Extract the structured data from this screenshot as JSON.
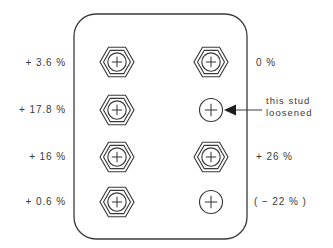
{
  "figure": {
    "plate": {
      "name": "plate",
      "x": 74,
      "y": 14,
      "width": 173,
      "height": 225,
      "corner_radius": 22,
      "stroke_color": "#3a3a3a",
      "fill_color": "#ffffff"
    },
    "ink_color": "#3a3a3a",
    "background_color": "#ffffff"
  },
  "studs": [
    {
      "id": "stud-left-1",
      "column": "left",
      "row": 1,
      "cx": 117,
      "cy": 62,
      "has_nut": true,
      "label": "+ 3.6 %",
      "label_side": "left"
    },
    {
      "id": "stud-left-2",
      "column": "left",
      "row": 2,
      "cx": 117,
      "cy": 110,
      "has_nut": true,
      "label": "+ 17.8 %",
      "label_side": "left"
    },
    {
      "id": "stud-left-3",
      "column": "left",
      "row": 3,
      "cx": 117,
      "cy": 157,
      "has_nut": true,
      "label": "+ 16 %",
      "label_side": "left"
    },
    {
      "id": "stud-left-4",
      "column": "left",
      "row": 4,
      "cx": 117,
      "cy": 202,
      "has_nut": true,
      "label": "+ 0.6 %",
      "label_side": "left"
    },
    {
      "id": "stud-right-1",
      "column": "right",
      "row": 1,
      "cx": 211,
      "cy": 62,
      "has_nut": true,
      "label": "0 %",
      "label_side": "right"
    },
    {
      "id": "stud-right-2",
      "column": "right",
      "row": 2,
      "cx": 211,
      "cy": 110,
      "has_nut": false,
      "label": "",
      "label_side": "right"
    },
    {
      "id": "stud-right-3",
      "column": "right",
      "row": 3,
      "cx": 211,
      "cy": 157,
      "has_nut": true,
      "label": "+ 26 %",
      "label_side": "right"
    },
    {
      "id": "stud-right-4",
      "column": "right",
      "row": 4,
      "cx": 211,
      "cy": 202,
      "has_nut": false,
      "label": "( − 22 % )",
      "label_side": "right"
    }
  ],
  "labels": {
    "left": [
      {
        "text": "+ 3.6 %",
        "x": 66,
        "y": 66
      },
      {
        "text": "+ 17.8 %",
        "x": 66,
        "y": 113
      },
      {
        "text": "+ 16 %",
        "x": 66,
        "y": 160
      },
      {
        "text": "+ 0.6 %",
        "x": 66,
        "y": 205
      }
    ],
    "right": [
      {
        "text": "0 %",
        "x": 256,
        "y": 66
      },
      {
        "text": "+ 26 %",
        "x": 256,
        "y": 160
      },
      {
        "text": "( − 22 % )",
        "x": 254,
        "y": 205
      }
    ]
  },
  "callout": {
    "name": "loosened-stud-callout",
    "line1": "this stud",
    "line2": "loosened",
    "text_x": 266,
    "text_y1": 104,
    "text_y2": 116,
    "arrow_tip_x": 224,
    "arrow_tip_y": 110,
    "arrow_tail_x": 262,
    "points_to": "stud-right-2"
  },
  "geometry": {
    "hex_outer_radius": 17,
    "hex_inner_radius": 13.5,
    "circle_radius": 9.2,
    "cross_arm": 5.2,
    "lone_circle_radius": 11.5,
    "lone_cross_arm": 6.2
  }
}
